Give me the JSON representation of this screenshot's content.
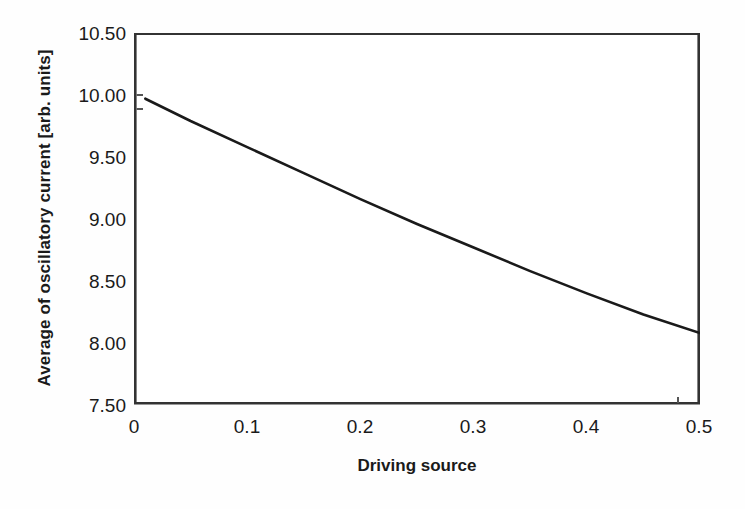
{
  "chart_data": {
    "type": "line",
    "title": "",
    "xlabel": "Driving source",
    "ylabel": "Average of oscillatory current [arb. units]",
    "xlim": [
      0,
      0.5
    ],
    "ylim": [
      7.5,
      10.5
    ],
    "grid": false,
    "legend": null,
    "x_ticks": [
      "0",
      "0.1",
      "0.2",
      "0.3",
      "0.4",
      "0.5"
    ],
    "x_tick_values": [
      0,
      0.1,
      0.2,
      0.3,
      0.4,
      0.5
    ],
    "y_ticks": [
      "10.50",
      "10.00",
      "9.50",
      "9.00",
      "8.50",
      "8.00",
      "7.50"
    ],
    "y_tick_values": [
      10.5,
      10.0,
      9.5,
      9.0,
      8.5,
      8.0,
      7.5
    ],
    "series": [
      {
        "name": "Average of oscillatory current",
        "color": "#1a1a1a",
        "line_width": 2.6,
        "x": [
          0.01,
          0.05,
          0.1,
          0.15,
          0.2,
          0.25,
          0.3,
          0.35,
          0.4,
          0.45,
          0.5
        ],
        "values": [
          9.97,
          9.79,
          9.58,
          9.37,
          9.16,
          8.96,
          8.77,
          8.58,
          8.4,
          8.23,
          8.08
        ]
      }
    ]
  },
  "axes": {
    "frame_color": "#333333",
    "background": "#ffffff"
  }
}
